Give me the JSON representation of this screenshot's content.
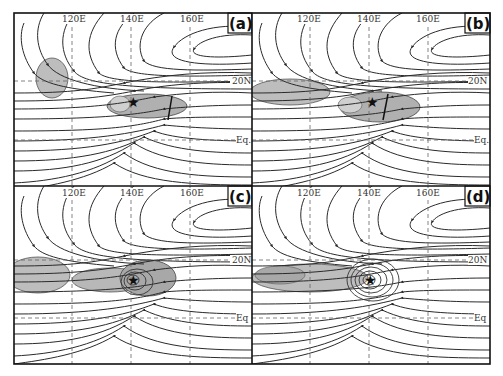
{
  "figure": {
    "panels": [
      {
        "id": "a",
        "label": "(a)",
        "lon_labels": [
          "120E",
          "140E",
          "160E"
        ],
        "lat_labels": [
          "20N",
          "Eq."
        ],
        "shading": [
          {
            "type": "blob",
            "cx": 52,
            "cy": 78,
            "rx": 18,
            "ry": 20
          },
          {
            "type": "elongated",
            "cx": 144,
            "cy": 106,
            "rx": 42,
            "ry": 14
          }
        ],
        "star": {
          "x": 133,
          "y": 102
        },
        "trough_line": true
      },
      {
        "id": "b",
        "label": "(b)",
        "lon_labels": [
          "120E",
          "140E",
          "160E"
        ],
        "lat_labels": [
          "20N",
          "Eq."
        ],
        "shading": [
          {
            "type": "band",
            "cx": 36,
            "cy": 92,
            "rx": 40,
            "ry": 14
          },
          {
            "type": "elongated",
            "cx": 137,
            "cy": 108,
            "rx": 40,
            "ry": 16
          }
        ],
        "star": {
          "x": 121,
          "y": 102
        },
        "trough_line": true
      },
      {
        "id": "c",
        "label": "(c)",
        "lon_labels": [
          "120E",
          "140E",
          "160E"
        ],
        "lat_labels": [
          "20N",
          "Eq"
        ],
        "shading": [
          {
            "type": "band",
            "cx": 30,
            "cy": 87,
            "rx": 32,
            "ry": 18
          },
          {
            "type": "elongated",
            "cx": 130,
            "cy": 95,
            "rx": 60,
            "ry": 16
          }
        ],
        "star": {
          "x": 133,
          "y": 94
        },
        "vortex": true
      },
      {
        "id": "d",
        "label": "(d)",
        "lon_labels": [
          "120E",
          "140E",
          "160E"
        ],
        "lat_labels": [
          "20N",
          "Eq"
        ],
        "shading": [
          {
            "type": "band",
            "cx": 60,
            "cy": 90,
            "rx": 70,
            "ry": 14
          }
        ],
        "star": {
          "x": 118,
          "y": 94
        },
        "vortex": true
      }
    ]
  }
}
